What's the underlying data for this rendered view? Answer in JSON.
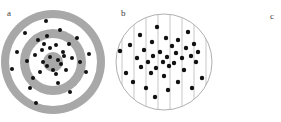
{
  "figure": {
    "width": 281,
    "height": 122,
    "background_color": "#ffffff"
  },
  "panels": [
    {
      "id": "a",
      "label": "a",
      "label_x": 7,
      "label_y": 9,
      "type": "concentric-ring-target",
      "center_x": 53,
      "center_y": 62,
      "dot_radius": 2.0,
      "dot_color": "#111111",
      "ring_gray": "#a8a8a8",
      "ring_white": "#ffffff",
      "rings": [
        {
          "name": "outer-gray-ring",
          "outer_radius": 52,
          "inner_radius": 44,
          "fill": "#a8a8a8"
        },
        {
          "name": "outer-white-ring",
          "outer_radius": 44,
          "inner_radius": 33,
          "fill": "#ffffff"
        },
        {
          "name": "mid-gray-ring",
          "outer_radius": 33,
          "inner_radius": 24,
          "fill": "#a8a8a8"
        },
        {
          "name": "inner-white-ring",
          "outer_radius": 24,
          "inner_radius": 10,
          "fill": "#ffffff"
        },
        {
          "name": "bullseye-core",
          "outer_radius": 10,
          "inner_radius": 0,
          "fill": "#a8a8a8"
        }
      ],
      "points": [
        [
          46,
          21
        ],
        [
          25,
          33
        ],
        [
          77,
          38
        ],
        [
          17,
          52
        ],
        [
          89,
          54
        ],
        [
          12,
          69
        ],
        [
          86,
          72
        ],
        [
          30,
          88
        ],
        [
          70,
          92
        ],
        [
          36,
          103
        ],
        [
          60,
          30
        ],
        [
          38,
          40
        ],
        [
          69,
          44
        ],
        [
          27,
          61
        ],
        [
          80,
          62
        ],
        [
          33,
          78
        ],
        [
          58,
          83
        ],
        [
          47,
          36
        ],
        [
          63,
          52
        ],
        [
          42,
          50
        ],
        [
          44,
          44
        ],
        [
          56,
          45
        ],
        [
          50,
          57
        ],
        [
          58,
          60
        ],
        [
          61,
          64
        ],
        [
          47,
          66
        ],
        [
          53,
          70
        ],
        [
          43,
          62
        ],
        [
          64,
          56
        ],
        [
          40,
          72
        ],
        [
          56,
          74
        ],
        [
          66,
          70
        ],
        [
          72,
          58
        ],
        [
          35,
          55
        ],
        [
          50,
          48
        ]
      ]
    },
    {
      "id": "b",
      "label": "b",
      "label_x": 13,
      "label_y": 9,
      "type": "strip-transect-circle",
      "center_x": 56,
      "center_y": 62,
      "radius": 48,
      "outline_color": "#9a9a9a",
      "strip_line_color": "#b0b0b0",
      "strip_count": 8,
      "strip_spacing": 12,
      "dot_radius": 2.2,
      "dot_color": "#111111",
      "points": [
        [
          49,
          27
        ],
        [
          80,
          32
        ],
        [
          32,
          35
        ],
        [
          58,
          38
        ],
        [
          70,
          40
        ],
        [
          22,
          45
        ],
        [
          44,
          42
        ],
        [
          86,
          44
        ],
        [
          12,
          51
        ],
        [
          64,
          46
        ],
        [
          78,
          48
        ],
        [
          90,
          52
        ],
        [
          36,
          50
        ],
        [
          52,
          52
        ],
        [
          68,
          53
        ],
        [
          83,
          56
        ],
        [
          29,
          58
        ],
        [
          45,
          56
        ],
        [
          59,
          57
        ],
        [
          74,
          58
        ],
        [
          40,
          62
        ],
        [
          55,
          62
        ],
        [
          66,
          63
        ],
        [
          88,
          62
        ],
        [
          33,
          67
        ],
        [
          48,
          68
        ],
        [
          61,
          66
        ],
        [
          76,
          70
        ],
        [
          43,
          73
        ],
        [
          56,
          76
        ],
        [
          25,
          82
        ],
        [
          70,
          82
        ],
        [
          94,
          78
        ],
        [
          38,
          88
        ],
        [
          60,
          90
        ],
        [
          47,
          97
        ],
        [
          84,
          88
        ],
        [
          18,
          73
        ]
      ]
    },
    {
      "id": "c",
      "label": "c",
      "label_x": 44,
      "label_y": 12,
      "type": "blank",
      "points": []
    }
  ]
}
